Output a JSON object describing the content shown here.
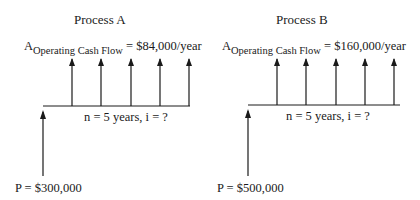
{
  "diagrams": [
    {
      "title": "Process A",
      "annuity_symbol": "A",
      "annuity_subscript": "Operating Cash Flow",
      "annuity_value": " = $84,000/year",
      "period_label": "n = 5 years, i = ?",
      "present_value_label": "P = $300,000",
      "periods": 5
    },
    {
      "title": "Process B",
      "annuity_symbol": "A",
      "annuity_subscript": "Operating Cash Flow",
      "annuity_value": " = $160,000/year",
      "period_label": "n = 5 years, i = ?",
      "present_value_label": "P = $500,000",
      "periods": 5
    }
  ],
  "colors": {
    "line": "#1a1a1a",
    "background": "#ffffff"
  }
}
